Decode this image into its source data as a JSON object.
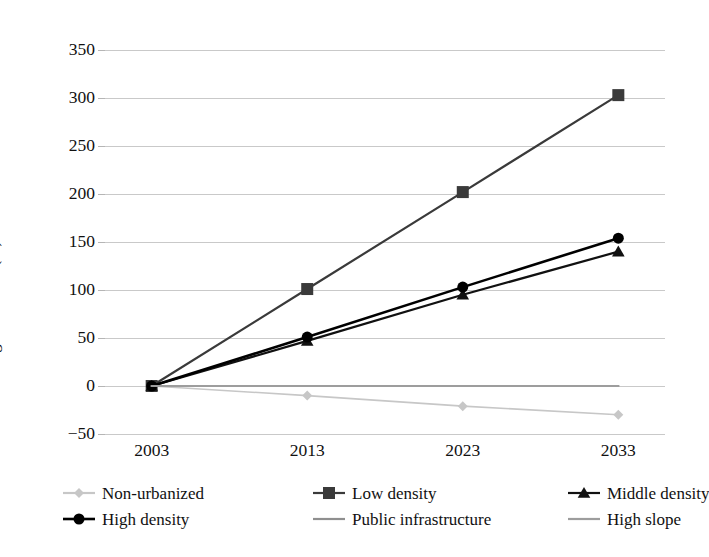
{
  "chart_data": {
    "type": "line",
    "title": "",
    "xlabel": "",
    "ylabel": "Percentage variation (%)",
    "categories": [
      "2003",
      "2013",
      "2023",
      "2033"
    ],
    "x": [
      2003,
      2013,
      2023,
      2033
    ],
    "ylim": [
      -50,
      350
    ],
    "xlim": [
      2000,
      2036
    ],
    "yticks": [
      -50,
      0,
      50,
      100,
      150,
      200,
      250,
      300,
      350
    ],
    "ytick_labels": [
      "−50",
      "0",
      "50",
      "100",
      "150",
      "200",
      "250",
      "300",
      "350"
    ],
    "grid": "horizontal",
    "legend_position": "below-axis",
    "legend_columns": 3,
    "series": [
      {
        "name": "Non-urbanized",
        "values": [
          0,
          -10,
          -21,
          -30
        ],
        "color": "#c7c7c7",
        "marker": "diamond",
        "marker_size": 5,
        "line_width": 1.6
      },
      {
        "name": "Low density",
        "values": [
          0,
          101,
          202,
          303
        ],
        "color": "#3a3a3a",
        "marker": "square",
        "marker_size": 6,
        "line_width": 2.2
      },
      {
        "name": "Middle density",
        "values": [
          0,
          47,
          95,
          140
        ],
        "color": "#111111",
        "marker": "triangle",
        "marker_size": 6,
        "line_width": 2.2
      },
      {
        "name": "High density",
        "values": [
          0,
          51,
          103,
          154
        ],
        "color": "#000000",
        "marker": "circle",
        "marker_size": 5.5,
        "line_width": 2.6
      },
      {
        "name": "Public infrastructure",
        "values": [
          0,
          0,
          0,
          0
        ],
        "color": "#8f8f8f",
        "marker": "none",
        "marker_size": 0,
        "line_width": 2.2
      },
      {
        "name": "High slope",
        "values": [
          0,
          0,
          0,
          0
        ],
        "color": "#9d9d9d",
        "marker": "none",
        "marker_size": 0,
        "line_width": 2.2
      }
    ]
  },
  "axis": {
    "y_title": "Percentage variation (%)"
  },
  "legend": {
    "items": [
      {
        "label": "Non-urbanized"
      },
      {
        "label": "Low density"
      },
      {
        "label": "Middle density"
      },
      {
        "label": "High density"
      },
      {
        "label": "Public infrastructure"
      },
      {
        "label": "High slope"
      }
    ]
  },
  "style": {
    "background": "#ffffff",
    "gridline_color": "#c9c9c9",
    "text_color": "#111111"
  }
}
